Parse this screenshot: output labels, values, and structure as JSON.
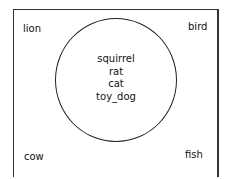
{
  "diagram": {
    "type": "venn",
    "outside": {
      "top_left": "lion",
      "top_right": "bird",
      "bottom_left": "cow",
      "bottom_right": "fish"
    },
    "circle_items": [
      "squirrel",
      "rat",
      "cat",
      "toy_dog"
    ]
  }
}
